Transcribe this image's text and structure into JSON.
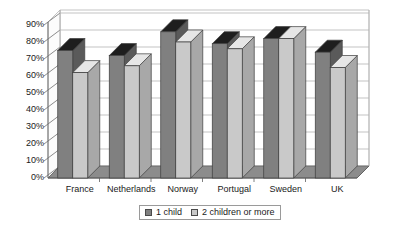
{
  "chart_data": {
    "type": "bar",
    "title": "",
    "subtitle": "",
    "xlabel": "",
    "ylabel": "",
    "categories": [
      "France",
      "Netherlands",
      "Norway",
      "Portugal",
      "Sweden",
      "UK"
    ],
    "series": [
      {
        "name": "1 child",
        "color": "#808080",
        "values": [
          75,
          72,
          86,
          79,
          82,
          74
        ]
      },
      {
        "name": "2 children or more",
        "color": "#c9c9c9",
        "values": [
          62,
          66,
          80,
          76,
          82,
          65
        ]
      }
    ],
    "ylim": [
      0,
      90
    ],
    "ytick_step": 10,
    "ytick_labels": [
      "90%",
      "80%",
      "70%",
      "60%",
      "50%",
      "40%",
      "30%",
      "20%",
      "10%",
      "0%"
    ],
    "ytick_values": [
      90,
      80,
      70,
      60,
      50,
      40,
      30,
      20,
      10,
      0
    ],
    "grid": true,
    "grid_axis": "y",
    "legend_position": "bottom-center",
    "style": "3d-clustered-column",
    "value_suffix": "%"
  },
  "axis": {
    "y_labels": [
      "90%",
      "80%",
      "70%",
      "60%",
      "50%",
      "40%",
      "30%",
      "20%",
      "10%",
      "0%"
    ],
    "x_labels": [
      "France",
      "Netherlands",
      "Norway",
      "Portugal",
      "Sweden",
      "UK"
    ]
  },
  "legend": {
    "items": [
      {
        "label": "1 child",
        "color": "#808080"
      },
      {
        "label": "2 children or more",
        "color": "#c9c9c9"
      }
    ]
  },
  "colors": {
    "series_1_child": "#808080",
    "series_2_children": "#c9c9c9",
    "series_1_child_top": "#1e1e1e",
    "series_2_children_top": "#e6e6e6",
    "series_1_child_side": "#5a5a5a",
    "series_2_children_side": "#a8a8a8",
    "grid": "#b4b4b4",
    "axis": "#6e6e6e",
    "floor": "#8c8c8c",
    "text": "#1a1a1a",
    "background": "#ffffff"
  }
}
